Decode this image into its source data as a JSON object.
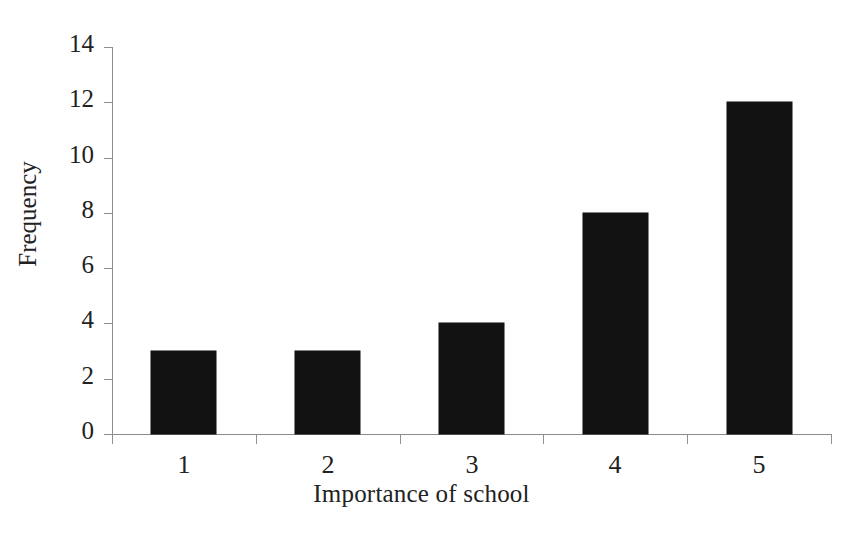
{
  "chart_data": {
    "type": "bar",
    "title": "",
    "subtitle": "",
    "categories": [
      "1",
      "2",
      "3",
      "4",
      "5"
    ],
    "values": [
      3,
      3,
      4,
      8,
      12
    ],
    "xlabel": "Importance of school",
    "ylabel": "Frequency",
    "ylim": [
      0,
      14
    ],
    "ytick_labels": [
      "0",
      "2",
      "4",
      "6",
      "8",
      "10",
      "12",
      "14"
    ],
    "ytick_values": [
      0,
      2,
      4,
      6,
      8,
      10,
      12,
      14
    ],
    "grid": false,
    "legend": false,
    "legend_position": "none",
    "bar_color": "#121212",
    "axis_color": "#8e8e8e",
    "background_color": "#ffffff",
    "annotations": []
  }
}
